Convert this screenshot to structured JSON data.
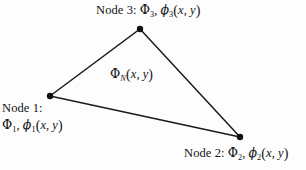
{
  "figure": {
    "background_color": "#fdfdfd",
    "line_color": "#1a1a1a",
    "node_color": "#111111"
  },
  "geometry": {
    "vertices": [
      {
        "id": "node1",
        "x": 50,
        "y": 96
      },
      {
        "id": "node2",
        "x": 240,
        "y": 137
      },
      {
        "id": "node3",
        "x": 140,
        "y": 29
      }
    ],
    "edges": [
      {
        "from": "node1",
        "to": "node3"
      },
      {
        "from": "node3",
        "to": "node2"
      },
      {
        "from": "node2",
        "to": "node1"
      }
    ],
    "node_radius": 3.2
  },
  "labels": {
    "node3": {
      "prefix": "Node 3:",
      "potential": "Φ",
      "potential_sub": "3",
      "basis": "ϕ",
      "basis_sub": "3",
      "args_open": "(",
      "arg_x": "x",
      "arg_comma": ",",
      "arg_y": "y",
      "args_close": ")",
      "comma": ","
    },
    "node1": {
      "prefix": "Node 1:",
      "potential": "Φ",
      "potential_sub": "1",
      "basis": "ϕ",
      "basis_sub": "1",
      "args_open": "(",
      "arg_x": "x",
      "arg_comma": ",",
      "arg_y": "y",
      "args_close": ")",
      "comma": ","
    },
    "node2": {
      "prefix": "Node 2:",
      "potential": "Φ",
      "potential_sub": "2",
      "basis": "ϕ",
      "basis_sub": "2",
      "args_open": "(",
      "arg_x": "x",
      "arg_comma": ",",
      "arg_y": "y",
      "args_close": ")",
      "comma": ","
    },
    "interior": {
      "potential": "Φ",
      "potential_sub": "N",
      "args_open": "(",
      "arg_x": "x",
      "arg_comma": ",",
      "arg_y": "y",
      "args_close": ")"
    }
  }
}
